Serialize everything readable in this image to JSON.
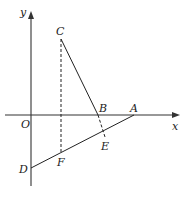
{
  "diagram": {
    "type": "coordinate-geometry",
    "axes": {
      "x_label": "x",
      "y_label": "y",
      "origin_label": "O"
    },
    "points": {
      "O": {
        "label": "O",
        "x": 31,
        "y": 115
      },
      "A": {
        "label": "A",
        "x": 134,
        "y": 115
      },
      "B": {
        "label": "B",
        "x": 98,
        "y": 115
      },
      "C": {
        "label": "C",
        "x": 61,
        "y": 39
      },
      "D": {
        "label": "D",
        "x": 31,
        "y": 168
      },
      "E": {
        "label": "E",
        "x": 105,
        "y": 137
      },
      "F": {
        "label": "F",
        "x": 61,
        "y": 152
      }
    },
    "segments": [
      {
        "from": "C",
        "to": "B",
        "style": "solid"
      },
      {
        "from": "B",
        "to": "E",
        "style": "dashed"
      },
      {
        "from": "D",
        "to": "A",
        "style": "solid"
      },
      {
        "from": "C",
        "to": "F",
        "style": "dashed"
      }
    ],
    "colors": {
      "line": "#222222",
      "axis": "#333333",
      "background": "#ffffff"
    }
  }
}
